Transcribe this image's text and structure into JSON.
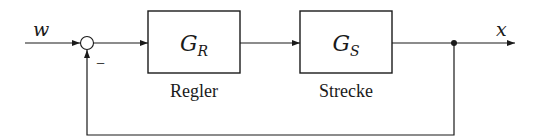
{
  "diagram": {
    "type": "block-diagram",
    "input": {
      "label": "w"
    },
    "summing_junction": {
      "feedback_sign": "−"
    },
    "blocks": [
      {
        "id": "controller",
        "symbol": "G",
        "subscript": "R",
        "caption": "Regler"
      },
      {
        "id": "plant",
        "symbol": "G",
        "subscript": "S",
        "caption": "Strecke"
      }
    ],
    "output": {
      "label": "x"
    },
    "colors": {
      "line": "#1a1a1a",
      "background": "#ffffff"
    }
  }
}
